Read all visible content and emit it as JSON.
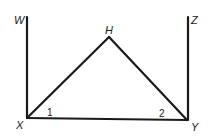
{
  "diagram": {
    "points": {
      "W": {
        "label": "W",
        "x": 27,
        "y": 17
      },
      "Z": {
        "label": "Z",
        "x": 188,
        "y": 17
      },
      "H": {
        "label": "H",
        "x": 109,
        "y": 37
      },
      "X": {
        "label": "X",
        "x": 27,
        "y": 118
      },
      "Y": {
        "label": "Y",
        "x": 187,
        "y": 120
      }
    },
    "segments": [
      [
        "X",
        "W"
      ],
      [
        "Y",
        "Z"
      ],
      [
        "X",
        "H"
      ],
      [
        "H",
        "Y"
      ],
      [
        "X",
        "Y"
      ]
    ],
    "angles": [
      {
        "label": "1",
        "vertex": "X"
      },
      {
        "label": "2",
        "vertex": "Y"
      }
    ]
  }
}
